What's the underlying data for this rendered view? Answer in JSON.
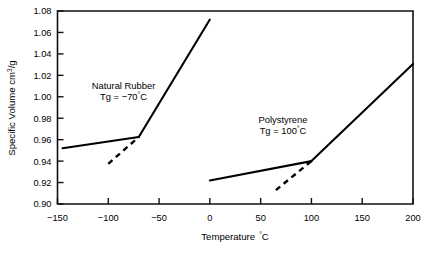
{
  "chart_data": {
    "type": "line",
    "title": "",
    "xlabel": "Temperature °C",
    "ylabel": "Specific Volume cm3/g",
    "ylabel_base": "Specific Volume cm",
    "ylabel_exponent": "3",
    "ylabel_tail": "/g",
    "xlabel_base": "Temperature",
    "xlabel_unit_deg": "°",
    "xlabel_unit_c": "C",
    "xlim": [
      -150,
      200
    ],
    "ylim": [
      0.9,
      1.08
    ],
    "xticks": [
      -150,
      -100,
      -50,
      0,
      50,
      100,
      150,
      200
    ],
    "xtick_labels": [
      "−150",
      "−100",
      "−50",
      "0",
      "50",
      "100",
      "150",
      "200"
    ],
    "yticks": [
      0.9,
      0.92,
      0.94,
      0.96,
      0.98,
      1.0,
      1.02,
      1.04,
      1.06,
      1.08
    ],
    "ytick_labels": [
      "0.90",
      "0.92",
      "0.94",
      "0.96",
      "0.98",
      "1.00",
      "1.02",
      "1.04",
      "1.06",
      "1.08"
    ],
    "grid": false,
    "legend": "none",
    "series": [
      {
        "name": "Natural Rubber glassy",
        "style": "solid",
        "points": [
          [
            -145,
            0.952
          ],
          [
            -70,
            0.9625
          ]
        ]
      },
      {
        "name": "Natural Rubber rubbery",
        "style": "solid",
        "points": [
          [
            -70,
            0.9625
          ],
          [
            0,
            1.072
          ]
        ]
      },
      {
        "name": "Natural Rubber extrapolation",
        "style": "dashed",
        "points": [
          [
            -100,
            0.9375
          ],
          [
            -70,
            0.9625
          ]
        ]
      },
      {
        "name": "Polystyrene glassy",
        "style": "solid",
        "points": [
          [
            0,
            0.922
          ],
          [
            100,
            0.94
          ]
        ]
      },
      {
        "name": "Polystyrene rubbery",
        "style": "solid",
        "points": [
          [
            100,
            0.94
          ],
          [
            200,
            1.0305
          ]
        ]
      },
      {
        "name": "Polystyrene extrapolation",
        "style": "dashed",
        "points": [
          [
            65,
            0.913
          ],
          [
            100,
            0.94
          ]
        ]
      }
    ],
    "annotations": [
      {
        "name": "natural-rubber",
        "line1": "Natural Rubber",
        "line2_prefix": "Tg = −70",
        "line2_deg": "°",
        "line2_unit": "C",
        "x": -85,
        "y": 1.0075
      },
      {
        "name": "polystyrene",
        "line1": "Polystyrene",
        "line2_prefix": "Tg = 100",
        "line2_deg": "°",
        "line2_unit": "C",
        "x": 72,
        "y": 0.976
      }
    ]
  },
  "colors": {
    "background": "#ffffff",
    "axis": "#111111",
    "data": "#000000"
  }
}
